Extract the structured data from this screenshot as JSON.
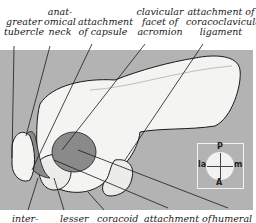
{
  "top_labels": [
    {
      "id": "greater-tubercle",
      "lines": [
        "greater",
        "tubercle"
      ]
    },
    {
      "id": "anatomical-neck",
      "lines": [
        "anat-",
        "omical",
        "neck"
      ]
    },
    {
      "id": "attachment-of-capsule",
      "lines": [
        "attachment",
        "of capsule"
      ]
    },
    {
      "id": "clavicular-facet",
      "lines": [
        "clavicular",
        "facet of",
        "acromion"
      ]
    },
    {
      "id": "coracoclavicular-attachment",
      "lines": [
        "attachment of",
        "coracoclavicular",
        "ligament"
      ]
    }
  ],
  "bottom_labels": [
    {
      "id": "inter",
      "text": "inter-"
    },
    {
      "id": "lesser",
      "text": "lesser"
    },
    {
      "id": "coracoid",
      "text": "coracoid"
    },
    {
      "id": "attachment-of",
      "text": "attachment of"
    },
    {
      "id": "humeral",
      "text": "humeral"
    }
  ],
  "compass": {
    "top": "P",
    "bottom": "A",
    "left": "la",
    "right": "m"
  },
  "colors": {
    "panel": "#b3b3b3",
    "bone": "#f4f4f2",
    "shade": "#8a8a8a",
    "line": "#1a1a1a",
    "compass_bg": "#f2f2f2"
  }
}
